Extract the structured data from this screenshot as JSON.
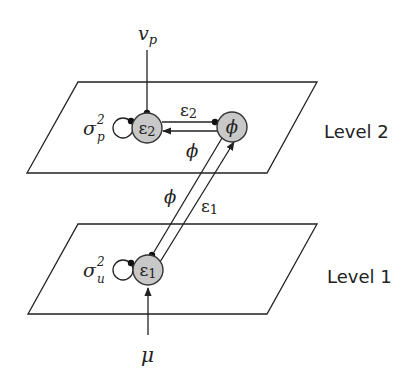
{
  "diagram": {
    "levels": [
      {
        "id": "level2",
        "label": "Level 2"
      },
      {
        "id": "level1",
        "label": "Level 1"
      }
    ],
    "nodes": {
      "eps2": {
        "symbol": "ε",
        "sub": "2"
      },
      "phi": {
        "symbol": "ϕ"
      },
      "eps1": {
        "symbol": "ε",
        "sub": "1"
      }
    },
    "inputs": {
      "top": {
        "symbol": "v",
        "sub": "p"
      },
      "bottom": {
        "symbol": "μ"
      }
    },
    "self_loops": {
      "eps2": {
        "symbol": "σ",
        "sup": "2",
        "sub": "p"
      },
      "eps1": {
        "symbol": "σ",
        "sup": "2",
        "sub": "u"
      }
    },
    "edge_labels": {
      "eps2_to_phi": {
        "symbol": "ε",
        "sub": "2"
      },
      "phi_to_eps2": {
        "symbol": "ϕ"
      },
      "eps1_to_phi": {
        "symbol": "ε",
        "sub": "1"
      },
      "phi_to_eps1": {
        "symbol": "ϕ"
      }
    },
    "colors": {
      "node_fill": "#c8c8c8",
      "stroke": "#222222"
    }
  }
}
